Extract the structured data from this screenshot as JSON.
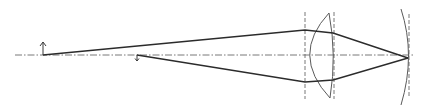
{
  "diagram": {
    "type": "optical-ray-diagram",
    "colors": {
      "ray": "#2b2b2b",
      "axis": "#6a6a6a",
      "surface": "#5a5a5a",
      "background": "#ffffff"
    },
    "elements": {
      "optical_axis": {
        "x1": 15,
        "y1": 55,
        "x2": 414,
        "y2": 55
      },
      "object_arrow": {
        "x": 43,
        "y_base": 55,
        "y_tip": 42,
        "direction": "up"
      },
      "image_arrow": {
        "x": 137,
        "y_base": 55,
        "y_tip": 61,
        "direction": "down"
      },
      "lens": {
        "left_guide_x": 305,
        "right_guide_x": 334,
        "top_y": 13,
        "bottom_y": 98
      },
      "mirror": {
        "guide_x": 409,
        "vertex_x": 407,
        "top_y": 9,
        "bottom_y": 105
      },
      "upper_ray": [
        [
          43,
          55
        ],
        [
          305,
          30
        ],
        [
          333,
          33
        ],
        [
          408,
          58
        ]
      ],
      "lower_ray": [
        [
          137,
          55
        ],
        [
          305,
          82
        ],
        [
          333,
          80
        ],
        [
          408,
          58
        ]
      ]
    }
  }
}
